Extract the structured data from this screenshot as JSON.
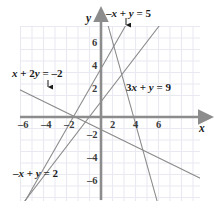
{
  "figure": {
    "type": "coordinate-plane-graph",
    "background_color": "#ffffff",
    "grid_color": "#e9e9f2",
    "axis_color": "#8c8c8c",
    "line_color": "#8a8a8a",
    "text_color": "#1b1b1b"
  },
  "axes": {
    "x_label": "x",
    "y_label": "y",
    "x_ticks": [
      "–6",
      "–4",
      "–2",
      "2",
      "4",
      "6"
    ],
    "x_tick_values": [
      -6,
      -4,
      -2,
      2,
      4,
      6
    ],
    "y_ticks": [
      "6",
      "4",
      "2",
      "–2",
      "–4",
      "–6"
    ],
    "y_tick_values": [
      6,
      4,
      2,
      -2,
      -4,
      -6
    ],
    "xlim": [
      -7,
      7.5
    ],
    "ylim": [
      -7,
      7.5
    ],
    "grid": true
  },
  "equation_labels": [
    {
      "id": "line-neg-x-plus-y-5",
      "text": "–x + y = 5",
      "arrow": "down",
      "arrow_icon": "down-arrow-icon"
    },
    {
      "id": "line-x-plus-2y-neg2",
      "text": "x + 2y = –2",
      "arrow": "down",
      "arrow_icon": "down-arrow-icon"
    },
    {
      "id": "line-3x-plus-y-9",
      "text": "3x + y = 9",
      "arrow": "none",
      "arrow_icon": ""
    },
    {
      "id": "line-neg-x-plus-y-2",
      "text": "–x + y = 2",
      "arrow": "none",
      "arrow_icon": ""
    }
  ],
  "chart_data": {
    "type": "line",
    "title": "",
    "xlabel": "x",
    "ylabel": "y",
    "xlim": [
      -7,
      7.5
    ],
    "ylim": [
      -7,
      7.5
    ],
    "grid": true,
    "legend_position": "inline-annotations",
    "series": [
      {
        "name": "–x + y = 5",
        "equation": "-x + y = 5",
        "slope": 1,
        "intercept": 5,
        "points": [
          [
            -7,
            -2
          ],
          [
            2.5,
            7.5
          ]
        ]
      },
      {
        "name": "–x + y = 2",
        "equation": "-x + y = 2",
        "slope": 1,
        "intercept": 2,
        "points": [
          [
            -7,
            -5
          ],
          [
            5.5,
            7.5
          ]
        ]
      },
      {
        "name": "3x + y = 9",
        "equation": "3x + y = 9",
        "slope": -3,
        "intercept": 9,
        "points": [
          [
            0.5,
            7.5
          ],
          [
            5.17,
            -6.5
          ]
        ]
      },
      {
        "name": "x + 2y = –2",
        "equation": "x + 2y = -2",
        "slope": -0.5,
        "intercept": -1,
        "points": [
          [
            -7,
            2.5
          ],
          [
            7,
            -4.5
          ]
        ]
      }
    ],
    "intersections": [
      {
        "lines": [
          "3x + y = 9",
          "x + 2y = –2"
        ],
        "point": [
          4,
          -3
        ]
      },
      {
        "lines": [
          "–x + y = 2",
          "x + 2y = –2"
        ],
        "point": [
          -2,
          0
        ]
      }
    ]
  }
}
